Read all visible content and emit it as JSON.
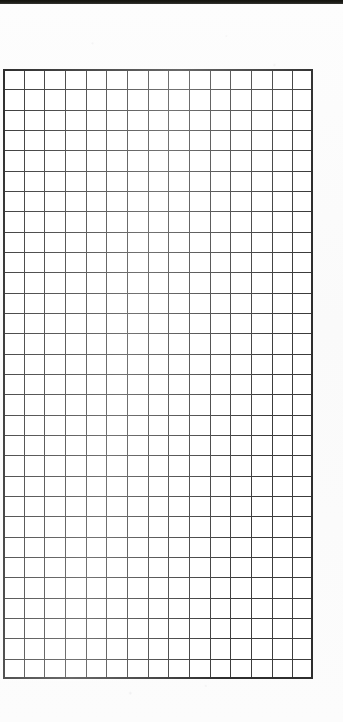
{
  "document": {
    "kind": "scanned-grid-paper",
    "background_color": "#fbfbfb",
    "width": 343,
    "height": 722
  },
  "top_edge_band": {
    "name": "scan-edge-band",
    "color": "#14140f",
    "height": 4
  },
  "grid": {
    "name": "graph-paper-grid",
    "columns": 15,
    "rows": 30,
    "cell_width": 20.666,
    "cell_height": 20.333,
    "left": 3,
    "top": 69,
    "width": 310,
    "height": 610,
    "line_color": "#3c3c3c",
    "border_color": "#2e2e2e",
    "cell_fill": "#ffffff"
  }
}
